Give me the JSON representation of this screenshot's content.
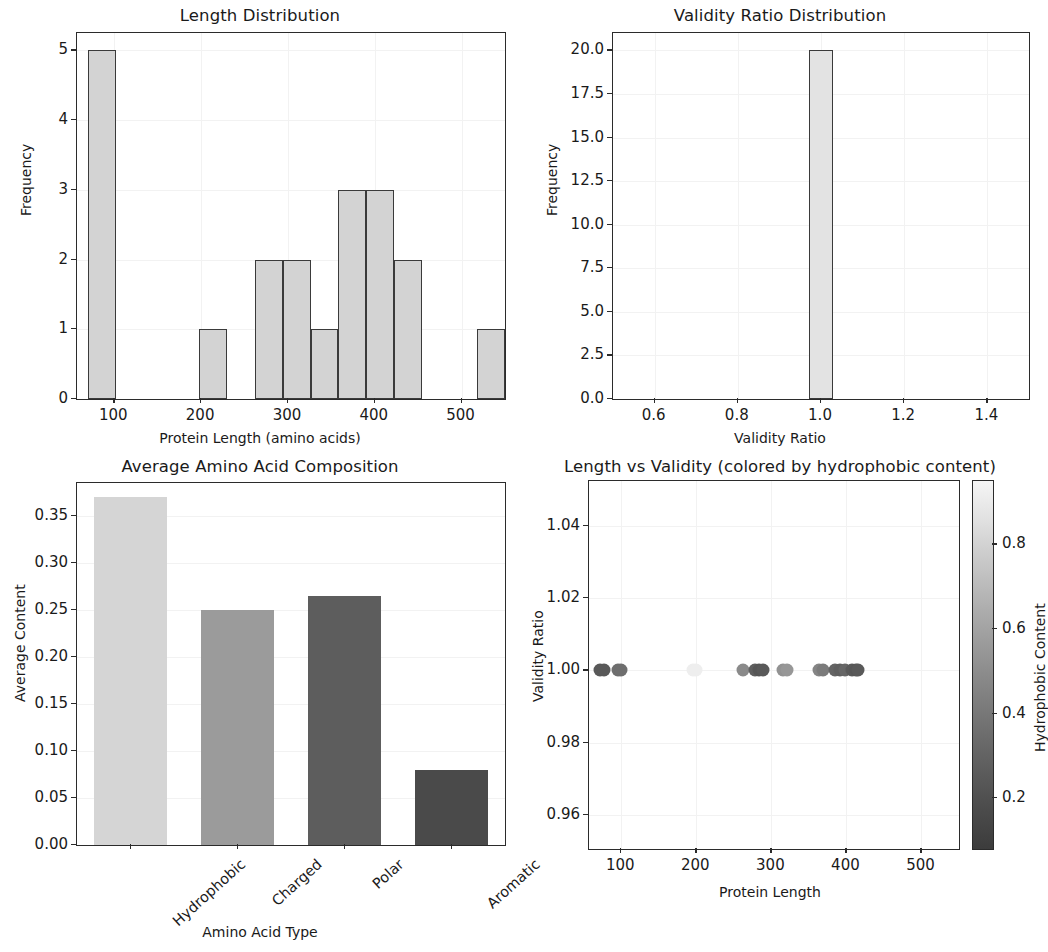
{
  "figure": {
    "width": 1040,
    "height": 952,
    "background": "#ffffff"
  },
  "chart_data": [
    {
      "id": "length_distribution",
      "type": "bar",
      "title": "Length Distribution",
      "xlabel": "Protein Length (amino acids)",
      "ylabel": "Frequency",
      "xlim": [
        57,
        550
      ],
      "ylim": [
        0,
        5.25
      ],
      "xticks": [
        100,
        200,
        300,
        400,
        500
      ],
      "xtick_labels": [
        "100",
        "200",
        "300",
        "400",
        "500"
      ],
      "yticks": [
        0,
        1,
        2,
        3,
        4,
        5
      ],
      "ytick_labels": [
        "0",
        "1",
        "2",
        "3",
        "4",
        "5"
      ],
      "grid": true,
      "bar_facecolor": "#d3d3d3",
      "bar_edgecolor": "#3a3a3a",
      "bin_edges": [
        70,
        102,
        134,
        166,
        198,
        230,
        262,
        294,
        326,
        358,
        390,
        422,
        454,
        486,
        518,
        550
      ],
      "bin_centers": [
        86,
        118,
        150,
        182,
        214,
        246,
        278,
        310,
        342,
        374,
        406,
        438,
        470,
        502,
        534
      ],
      "values": [
        5,
        0,
        0,
        0,
        1,
        0,
        2,
        2,
        1,
        3,
        3,
        2,
        0,
        0,
        1
      ]
    },
    {
      "id": "validity_ratio_distribution",
      "type": "bar",
      "title": "Validity Ratio Distribution",
      "xlabel": "Validity Ratio",
      "ylabel": "Frequency",
      "xlim": [
        0.5,
        1.5
      ],
      "ylim": [
        0,
        21
      ],
      "xticks": [
        0.6,
        0.8,
        1.0,
        1.2,
        1.4
      ],
      "xtick_labels": [
        "0.6",
        "0.8",
        "1.0",
        "1.2",
        "1.4"
      ],
      "yticks": [
        0.0,
        2.5,
        5.0,
        7.5,
        10.0,
        12.5,
        15.0,
        17.5,
        20.0
      ],
      "ytick_labels": [
        "0.0",
        "2.5",
        "5.0",
        "7.5",
        "10.0",
        "12.5",
        "15.0",
        "17.5",
        "20.0"
      ],
      "grid": true,
      "bar_facecolor": "#e3e3e3",
      "bar_edgecolor": "#3a3a3a",
      "bin_edges": [
        0.97,
        1.03
      ],
      "bin_centers": [
        1.0
      ],
      "values": [
        20
      ]
    },
    {
      "id": "average_amino_acid_composition",
      "type": "bar",
      "title": "Average Amino Acid Composition",
      "xlabel": "Amino Acid Type",
      "ylabel": "Average Content",
      "categories": [
        "Hydrophobic",
        "Charged",
        "Polar",
        "Aromatic"
      ],
      "values": [
        0.37,
        0.25,
        0.265,
        0.08
      ],
      "bar_colors": [
        "#d5d5d5",
        "#9b9b9b",
        "#5d5d5d",
        "#4a4a4a"
      ],
      "ylim": [
        0.0,
        0.385
      ],
      "yticks": [
        0.0,
        0.05,
        0.1,
        0.15,
        0.2,
        0.25,
        0.3,
        0.35
      ],
      "ytick_labels": [
        "0.00",
        "0.05",
        "0.10",
        "0.15",
        "0.20",
        "0.25",
        "0.30",
        "0.35"
      ],
      "grid": true,
      "xtick_rotation": -42
    },
    {
      "id": "length_vs_validity",
      "type": "scatter",
      "title": "Length vs Validity (colored by hydrophobic content)",
      "xlabel": "Protein Length",
      "ylabel": "Validity Ratio",
      "xlim": [
        57,
        550
      ],
      "ylim": [
        0.9505,
        1.0525
      ],
      "xticks": [
        100,
        200,
        300,
        400,
        500
      ],
      "xtick_labels": [
        "100",
        "200",
        "300",
        "400",
        "500"
      ],
      "yticks": [
        0.96,
        0.98,
        1.0,
        1.02,
        1.04
      ],
      "ytick_labels": [
        "0.96",
        "0.98",
        "1.00",
        "1.02",
        "1.04"
      ],
      "grid": true,
      "colorbar": {
        "label": "Hydrophobic Content",
        "ticks": [
          0.2,
          0.4,
          0.6,
          0.8
        ],
        "tick_labels": [
          "0.2",
          "0.4",
          "0.6",
          "0.8"
        ],
        "vmin": 0.08,
        "vmax": 0.95,
        "cmap": "grayscale-dark-to-light"
      },
      "points": [
        {
          "x": 72,
          "y": 1.0,
          "c": 0.3,
          "color": "#595959"
        },
        {
          "x": 77,
          "y": 1.0,
          "c": 0.3,
          "color": "#595959"
        },
        {
          "x": 95,
          "y": 1.0,
          "c": 0.4,
          "color": "#6e6e6e"
        },
        {
          "x": 100,
          "y": 1.0,
          "c": 0.4,
          "color": "#6e6e6e"
        },
        {
          "x": 196,
          "y": 1.0,
          "c": 0.93,
          "color": "#eeeeee"
        },
        {
          "x": 199,
          "y": 1.0,
          "c": 0.93,
          "color": "#eeeeee"
        },
        {
          "x": 262,
          "y": 1.0,
          "c": 0.52,
          "color": "#8a8a8a"
        },
        {
          "x": 278,
          "y": 1.0,
          "c": 0.33,
          "color": "#5f5f5f"
        },
        {
          "x": 284,
          "y": 1.0,
          "c": 0.28,
          "color": "#565656"
        },
        {
          "x": 289,
          "y": 1.0,
          "c": 0.3,
          "color": "#595959"
        },
        {
          "x": 316,
          "y": 1.0,
          "c": 0.56,
          "color": "#929292"
        },
        {
          "x": 321,
          "y": 1.0,
          "c": 0.58,
          "color": "#979797"
        },
        {
          "x": 363,
          "y": 1.0,
          "c": 0.5,
          "color": "#858585"
        },
        {
          "x": 369,
          "y": 1.0,
          "c": 0.46,
          "color": "#7b7b7b"
        },
        {
          "x": 385,
          "y": 1.0,
          "c": 0.35,
          "color": "#646464"
        },
        {
          "x": 391,
          "y": 1.0,
          "c": 0.33,
          "color": "#5f5f5f"
        },
        {
          "x": 398,
          "y": 1.0,
          "c": 0.36,
          "color": "#666666"
        },
        {
          "x": 408,
          "y": 1.0,
          "c": 0.3,
          "color": "#595959"
        },
        {
          "x": 413,
          "y": 1.0,
          "c": 0.28,
          "color": "#565656"
        },
        {
          "x": 416,
          "y": 1.0,
          "c": 0.3,
          "color": "#595959"
        }
      ]
    }
  ]
}
